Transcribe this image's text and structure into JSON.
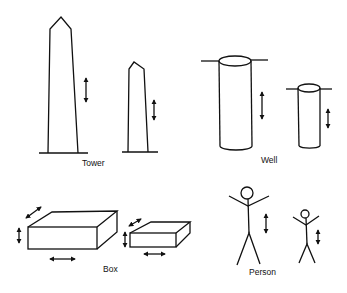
{
  "figure": {
    "colors": {
      "ink": "#111111",
      "background": "#ffffff"
    },
    "groups": [
      {
        "id": "tower",
        "label": "Tower",
        "label_pos": [
          95,
          165
        ],
        "scale_arrows": [
          "vertical"
        ]
      },
      {
        "id": "well",
        "label": "Well",
        "label_pos": [
          271,
          162
        ],
        "scale_arrows": [
          "vertical"
        ]
      },
      {
        "id": "box",
        "label": "Box",
        "label_pos": [
          111,
          271
        ],
        "scale_arrows": [
          "vertical",
          "horizontal",
          "depth"
        ]
      },
      {
        "id": "person",
        "label": "Person",
        "label_pos": [
          262,
          274
        ],
        "scale_arrows": [
          "vertical"
        ]
      }
    ]
  }
}
